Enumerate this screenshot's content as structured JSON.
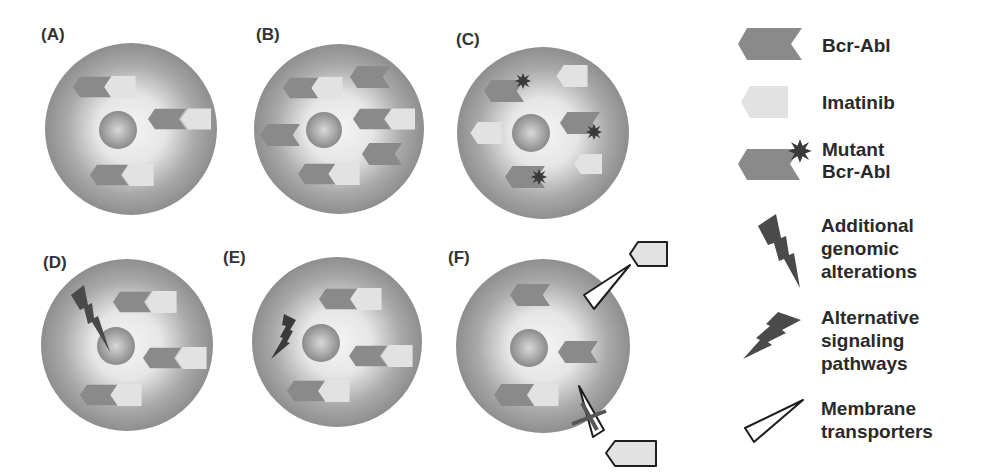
{
  "figure": {
    "panels": [
      {
        "id": "A",
        "label": "(A)"
      },
      {
        "id": "B",
        "label": "(B)"
      },
      {
        "id": "C",
        "label": "(C)"
      },
      {
        "id": "D",
        "label": "(D)"
      },
      {
        "id": "E",
        "label": "(E)"
      },
      {
        "id": "F",
        "label": "(F)"
      }
    ],
    "legend": [
      {
        "icon": "bcr-abl-icon",
        "lines": [
          "Bcr-Abl"
        ]
      },
      {
        "icon": "imatinib-icon",
        "lines": [
          "Imatinib"
        ]
      },
      {
        "icon": "mutant-bcr-abl-icon",
        "lines": [
          "Mutant",
          "Bcr-Abl"
        ]
      },
      {
        "icon": "lightning-genomic-icon",
        "lines": [
          "Additional",
          "genomic",
          "alterations"
        ]
      },
      {
        "icon": "lightning-signaling-icon",
        "lines": [
          "Alternative",
          "signaling",
          "pathways"
        ]
      },
      {
        "icon": "membrane-transporter-icon",
        "lines": [
          "Membrane",
          "transporters"
        ]
      }
    ],
    "colors": {
      "cell_outer": "#8f8f8f",
      "cell_inner": "#f2f2f2",
      "bcr_abl": "#8a8a8a",
      "imatinib": "#e0e0e0",
      "mutation_star": "#3a3a3a",
      "lightning": "#4a4a4a",
      "text": "#2a2a2a"
    }
  }
}
